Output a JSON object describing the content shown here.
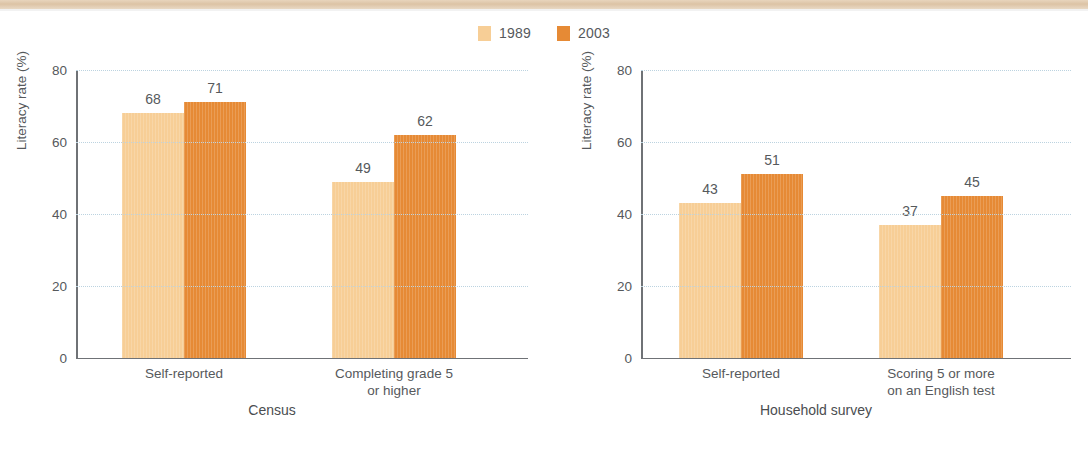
{
  "legend": {
    "items": [
      {
        "label": "1989",
        "color": "#F7CE96",
        "name": "legend-swatch-1989"
      },
      {
        "label": "2003",
        "color": "#E68A35",
        "name": "legend-swatch-2003"
      }
    ]
  },
  "axis": {
    "ylabel": "Literacy rate (%)",
    "ticks": [
      "0",
      "20",
      "40",
      "60",
      "80"
    ],
    "ymin": 0,
    "ymax": 80
  },
  "panels": {
    "left": {
      "title": "Census",
      "categories": [
        "Self-reported",
        "Completing grade 5\nor higher"
      ],
      "values_1989": [
        "68",
        "49"
      ],
      "values_2003": [
        "71",
        "62"
      ]
    },
    "right": {
      "title": "Household survey",
      "categories": [
        "Self-reported",
        "Scoring 5 or more\non an English test"
      ],
      "values_1989": [
        "43",
        "37"
      ],
      "values_2003": [
        "51",
        "45"
      ]
    }
  },
  "chart_data": {
    "type": "bar",
    "title": "",
    "subtitle": "",
    "xlabel": "",
    "ylabel": "Literacy rate (%)",
    "ylim": [
      0,
      80
    ],
    "yticks": [
      0,
      20,
      40,
      60,
      80
    ],
    "grid": true,
    "legend_position": "top-center",
    "legend": [
      "1989",
      "2003"
    ],
    "colors": {
      "1989": "#F7CE96",
      "2003": "#E68A35"
    },
    "panels": [
      {
        "panel_title": "Census",
        "categories": [
          "Self-reported",
          "Completing grade 5 or higher"
        ],
        "series": [
          {
            "name": "1989",
            "values": [
              68,
              49
            ]
          },
          {
            "name": "2003",
            "values": [
              71,
              62
            ]
          }
        ]
      },
      {
        "panel_title": "Household survey",
        "categories": [
          "Self-reported",
          "Scoring 5 or more on an English test"
        ],
        "series": [
          {
            "name": "1989",
            "values": [
              43,
              37
            ]
          },
          {
            "name": "2003",
            "values": [
              51,
              45
            ]
          }
        ]
      }
    ]
  }
}
